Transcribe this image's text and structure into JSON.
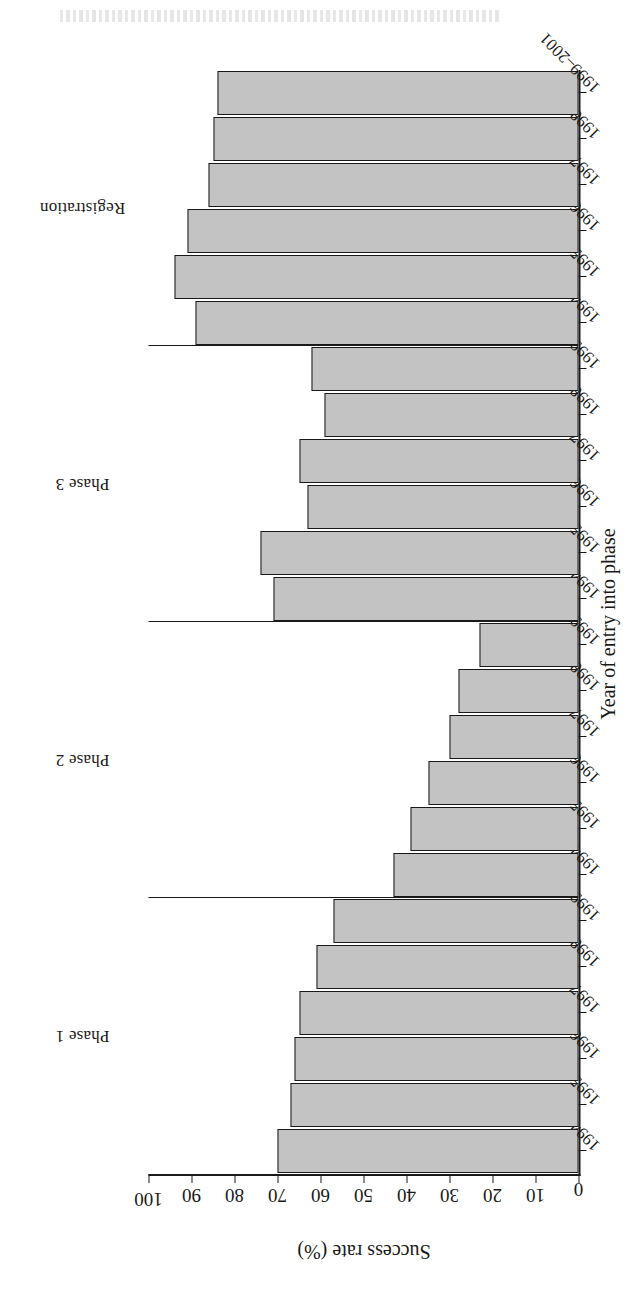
{
  "chart_data": {
    "type": "bar",
    "orientation": "horizontal-rotated",
    "title": "",
    "xlabel": "Year of entry into phase",
    "ylabel": "Success rate (%)",
    "ylim": [
      0,
      100
    ],
    "yticks": [
      100,
      90,
      80,
      70,
      60,
      50,
      40,
      30,
      20,
      10,
      0
    ],
    "grid": false,
    "legend": null,
    "bar_fill_color": "#c3c3c3",
    "bar_edge_color": "#1a1a1a",
    "groups": [
      {
        "label": "Phase 1",
        "categories": [
          "1994-1996",
          "1995-1997",
          "1996-1998",
          "1997-1999",
          "1998-2000",
          "1999-2001"
        ],
        "values": [
          70,
          67,
          66,
          65,
          61,
          57
        ]
      },
      {
        "label": "Phase 2",
        "categories": [
          "1994-1996",
          "1995-1997",
          "1996-1998",
          "1997-1999",
          "1998-2000",
          "1999-2001"
        ],
        "values": [
          43,
          39,
          35,
          30,
          28,
          23
        ]
      },
      {
        "label": "Phase 3",
        "categories": [
          "1994-1996",
          "1995-1997",
          "1996-1998",
          "1997-1999",
          "1998-2000",
          "1999-2001"
        ],
        "values": [
          71,
          74,
          63,
          65,
          59,
          62
        ]
      },
      {
        "label": "Registration",
        "categories": [
          "1994-1996",
          "1995-1997",
          "1996-1998",
          "1997-1999",
          "1998-2000",
          "1999-2001"
        ],
        "values": [
          89,
          94,
          91,
          86,
          85,
          84
        ]
      }
    ]
  }
}
